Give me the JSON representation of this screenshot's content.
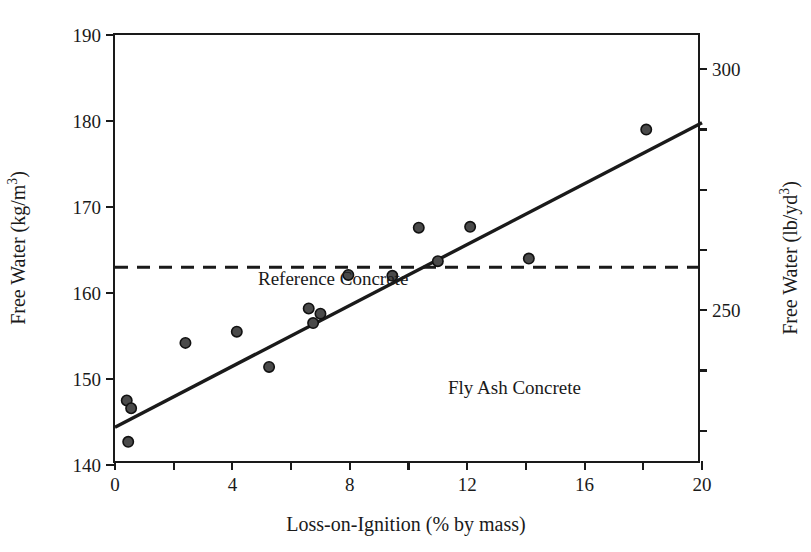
{
  "chart_data": {
    "type": "scatter",
    "title": "",
    "xlabel": "Loss-on-Ignition (% by mass)",
    "ylabel": "Free Water (kg/m3)",
    "ylabel_right": "Free Water (lb/yd3)",
    "xlim": [
      0,
      20
    ],
    "ylim": [
      140,
      190
    ],
    "ylim_right": [
      217.9,
      307.1
    ],
    "grid": false,
    "legend": "none",
    "x_ticks": [
      0,
      2,
      4,
      6,
      8,
      10,
      12,
      14,
      16,
      18,
      20
    ],
    "x_tick_labels": [
      "0",
      "",
      "4",
      "",
      "8",
      "",
      "12",
      "",
      "16",
      "",
      "20"
    ],
    "y_ticks_left": [
      140,
      150,
      160,
      170,
      180,
      190
    ],
    "y_tick_labels_left": [
      "140",
      "150",
      "160",
      "170",
      "180",
      "190"
    ],
    "y_ticks_right": [
      225,
      237.5,
      250,
      262.5,
      275,
      287.5,
      300
    ],
    "y_tick_labels_right": [
      "",
      "",
      "250",
      "",
      "",
      "",
      "300"
    ],
    "series": [
      {
        "name": "Fly Ash Concrete",
        "type": "scatter",
        "marker": "circle",
        "color": "#444444",
        "points": [
          {
            "x": 0.4,
            "y": 147.5
          },
          {
            "x": 0.55,
            "y": 146.6
          },
          {
            "x": 0.45,
            "y": 142.7
          },
          {
            "x": 2.4,
            "y": 154.2
          },
          {
            "x": 4.15,
            "y": 155.5
          },
          {
            "x": 5.25,
            "y": 151.4
          },
          {
            "x": 6.6,
            "y": 158.2
          },
          {
            "x": 6.75,
            "y": 156.5
          },
          {
            "x": 7.0,
            "y": 157.6
          },
          {
            "x": 7.95,
            "y": 162.1
          },
          {
            "x": 9.45,
            "y": 162.0
          },
          {
            "x": 10.35,
            "y": 167.6
          },
          {
            "x": 11.0,
            "y": 163.7
          },
          {
            "x": 12.1,
            "y": 167.7
          },
          {
            "x": 14.1,
            "y": 164.0
          },
          {
            "x": 18.1,
            "y": 179.0
          }
        ]
      },
      {
        "name": "Fly Ash Concrete trend line",
        "type": "line",
        "style": "solid",
        "color": "#1a1a1a",
        "points": [
          {
            "x": 0.0,
            "y": 144.4
          },
          {
            "x": 20.0,
            "y": 179.8
          }
        ]
      },
      {
        "name": "Reference Concrete",
        "type": "line",
        "style": "dashed",
        "color": "#1a1a1a",
        "points": [
          {
            "x": 0.0,
            "y": 163.0
          },
          {
            "x": 20.0,
            "y": 163.0
          }
        ]
      }
    ],
    "annotations": [
      {
        "text": "Reference Concrete",
        "x": 1.0,
        "y": 165.5
      },
      {
        "text": "Fly Ash Concrete",
        "x": 7.5,
        "y": 153.5
      }
    ]
  },
  "axes": {
    "left_title_main": "Free Water (kg/m",
    "left_title_sup": "3",
    "left_title_tail": ")",
    "right_title_main": "Free Water (lb/yd",
    "right_title_sup": "3",
    "right_title_tail": ")",
    "x_title": "Loss-on-Ignition (% by mass)"
  },
  "annotations": {
    "reference_concrete": "Reference Concrete",
    "fly_ash_concrete": "Fly Ash Concrete"
  },
  "colors": {
    "axis": "#1a1a1a",
    "marker_fill": "#4a4a4a",
    "marker_stroke": "#111111",
    "trend_line": "#1a1a1a",
    "reference_line": "#1a1a1a",
    "background": "#ffffff"
  }
}
